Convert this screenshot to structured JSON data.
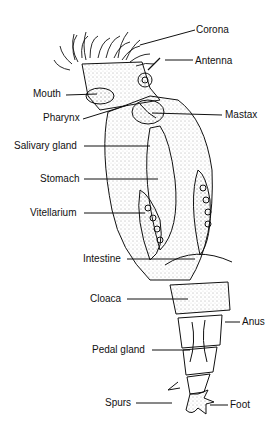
{
  "diagram": {
    "labels": {
      "corona": "Corona",
      "antenna": "Antenna",
      "mouth": "Mouth",
      "pharynx": "Pharynx",
      "mastax": "Mastax",
      "salivary_gland": "Salivary gland",
      "stomach": "Stomach",
      "vitellarium": "Vitellarium",
      "intestine": "Intestine",
      "cloaca": "Cloaca",
      "anus": "Anus",
      "pedal_gland": "Pedal gland",
      "spurs": "Spurs",
      "foot": "Foot"
    }
  }
}
